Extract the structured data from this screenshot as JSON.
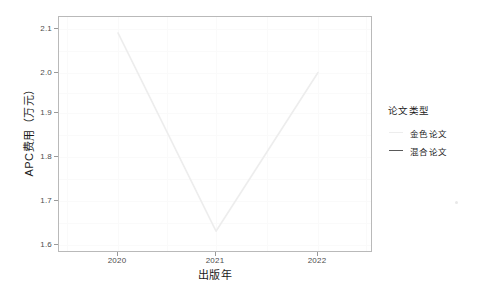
{
  "chart_data": {
    "type": "line",
    "title": "",
    "xlabel": "出版年",
    "ylabel": "APC费用（万元）",
    "x": [
      "2020",
      "2021",
      "2022"
    ],
    "xticklabels": [
      "2020",
      "2021",
      "2022"
    ],
    "yticklabels": [
      "1.6",
      "1.7",
      "1.8",
      "1.9",
      "2.0",
      "2.1"
    ],
    "ylim": [
      1.55,
      2.14
    ],
    "xlim": [
      2019.5,
      2022.5
    ],
    "grid": true,
    "legend_position": "right",
    "legend_title": "论文类型",
    "series": [
      {
        "name": "金色论文",
        "color": "#ededed",
        "values": [
          2.1,
          1.6,
          2.0
        ]
      },
      {
        "name": "混合论文",
        "color": "#595959",
        "values": [
          null,
          null,
          null
        ]
      }
    ]
  },
  "axes": {
    "y_ticks": [
      {
        "label": "1.6",
        "value": 1.6
      },
      {
        "label": "1.7",
        "value": 1.7
      },
      {
        "label": "1.8",
        "value": 1.8
      },
      {
        "label": "1.9",
        "value": 1.9
      },
      {
        "label": "2.0",
        "value": 2.0
      },
      {
        "label": "2.1",
        "value": 2.1
      }
    ],
    "x_ticks": [
      {
        "label": "2020",
        "value": 2020
      },
      {
        "label": "2021",
        "value": 2021
      },
      {
        "label": "2022",
        "value": 2022
      }
    ],
    "x_title": "出版年",
    "y_title": "APC费用（万元）"
  },
  "legend": {
    "title": "论文类型",
    "items": [
      {
        "label": "金色论文",
        "color": "#ededed"
      },
      {
        "label": "混合论文",
        "color": "#595959"
      }
    ]
  },
  "colors": {
    "panel_border": "#b9b9b9",
    "grid": "#fafafa",
    "text": "#1a1a1a",
    "tick_text": "#4d4d4d",
    "background": "#ffffff"
  }
}
